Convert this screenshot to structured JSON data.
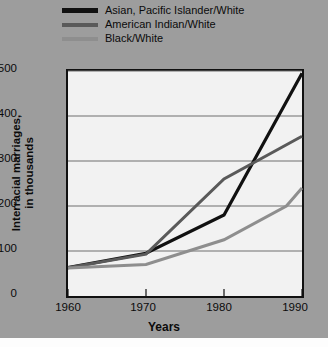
{
  "chart_data": {
    "type": "line",
    "title": "",
    "xlabel": "Years",
    "ylabel": "Interracial marriages,\nin thousands",
    "xlim": [
      1960,
      1990
    ],
    "ylim": [
      0,
      500
    ],
    "yticks": [
      0,
      100,
      200,
      300,
      400,
      500
    ],
    "xticks": [
      1960,
      1970,
      1980,
      1990
    ],
    "grid": "horizontal",
    "legend_position": "above-plot-left",
    "x": [
      1960,
      1970,
      1980,
      1990
    ],
    "series": [
      {
        "name": "Asian, Pacific Islander/White",
        "color": "#111111",
        "values": [
          63,
          95,
          180,
          495
        ],
        "points": [
          {
            "x": 1960,
            "y": 63
          },
          {
            "x": 1970,
            "y": 95
          },
          {
            "x": 1980,
            "y": 180
          },
          {
            "x": 1990,
            "y": 495
          }
        ]
      },
      {
        "name": "American Indian/White",
        "color": "#5a5a5a",
        "values": [
          63,
          93,
          260,
          355
        ],
        "points": [
          {
            "x": 1960,
            "y": 63
          },
          {
            "x": 1970,
            "y": 93
          },
          {
            "x": 1980,
            "y": 260
          },
          {
            "x": 1990,
            "y": 355
          }
        ]
      },
      {
        "name": "Black/White",
        "color": "#8e8e8e",
        "values": [
          62,
          70,
          125,
          240
        ],
        "points": [
          {
            "x": 1960,
            "y": 62
          },
          {
            "x": 1970,
            "y": 70
          },
          {
            "x": 1980,
            "y": 125
          },
          {
            "x": 1988,
            "y": 200
          },
          {
            "x": 1990,
            "y": 240
          }
        ]
      }
    ],
    "annotations": [
      "Asian, Pacific Islander/White line crosses American Indian/White line near 1984 at about 300 thousand"
    ]
  },
  "legend": {
    "items": [
      {
        "label": "Asian, Pacific Islander/White",
        "color": "#111111"
      },
      {
        "label": "American Indian/White",
        "color": "#5a5a5a"
      },
      {
        "label": "Black/White",
        "color": "#8e8e8e"
      }
    ]
  },
  "axes": {
    "y_title": "Interracial marriages,\nin thousands",
    "x_title": "Years",
    "y_tick_labels": [
      "500",
      "400",
      "300",
      "200",
      "100",
      "0"
    ],
    "x_tick_labels": [
      "1960",
      "1970",
      "1980",
      "1990"
    ]
  },
  "colors": {
    "background": "#9d9d9d",
    "plot_background": "#f2f2f2",
    "frame": "#111111",
    "gridline": "#6e6e6e",
    "text": "#0b0b0b"
  }
}
